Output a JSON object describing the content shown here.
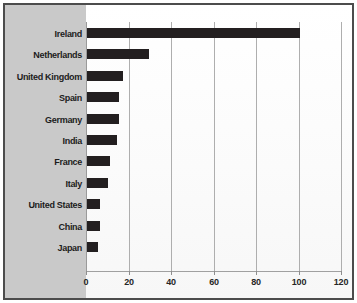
{
  "chart_data": {
    "type": "bar",
    "orientation": "horizontal",
    "title": "",
    "xlabel": "",
    "ylabel": "",
    "xlim": [
      0,
      120
    ],
    "xticks": [
      0,
      20,
      40,
      60,
      80,
      100,
      120
    ],
    "xtick_labels": [
      "0",
      "20",
      "40",
      "60",
      "80",
      "100",
      "120"
    ],
    "grid": true,
    "grid_axis": "x",
    "legend": false,
    "categories": [
      "Ireland",
      "Netherlands",
      "United Kingdom",
      "Spain",
      "Germany",
      "India",
      "France",
      "Italy",
      "United States",
      "China",
      "Japan"
    ],
    "values": [
      100,
      29,
      17,
      15,
      15,
      14,
      11,
      10,
      6,
      6,
      5
    ],
    "bar_color": "#231f20",
    "panel_color": "#c9c9c9",
    "plot_background": "#fcfcfc",
    "frame_color": "#4c4c4c",
    "gridline_color": "#aeaeae"
  }
}
